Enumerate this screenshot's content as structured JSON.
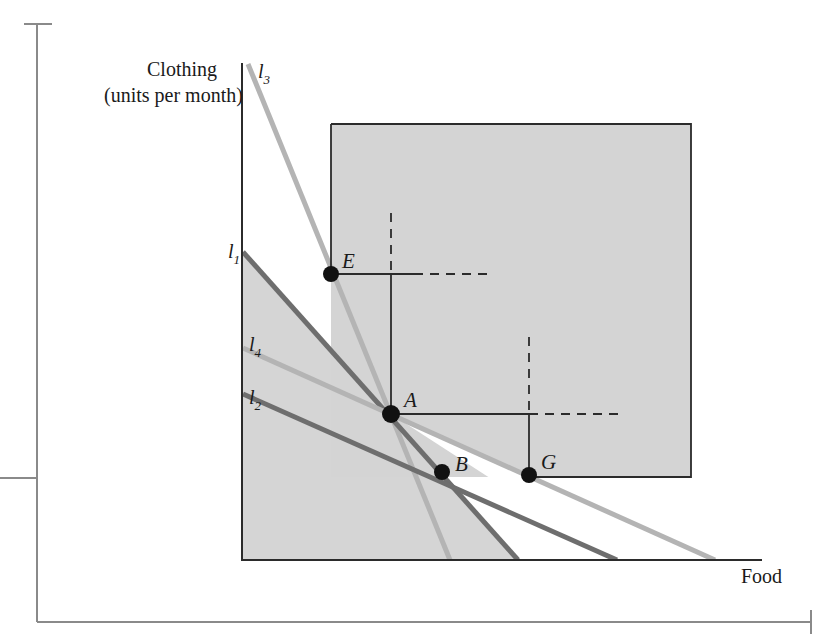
{
  "figure": {
    "axes": {
      "y_label_line1": "Clothing",
      "y_label_line2": "(units per month)",
      "x_label": "Food"
    },
    "line_labels": [
      {
        "id": "l3",
        "base": "l",
        "sub": "3"
      },
      {
        "id": "l1",
        "base": "l",
        "sub": "1"
      },
      {
        "id": "l4",
        "base": "l",
        "sub": "4"
      },
      {
        "id": "l2",
        "base": "l",
        "sub": "2"
      }
    ],
    "point_labels": [
      {
        "id": "E",
        "text": "E"
      },
      {
        "id": "A",
        "text": "A"
      },
      {
        "id": "B",
        "text": "B"
      },
      {
        "id": "G",
        "text": "G"
      }
    ],
    "colors": {
      "dark_line": "#6e6e6e",
      "light_line": "#b4b4b4",
      "shade": "#d4d4d4",
      "axis": "#2b2b2b",
      "frame": "#8a8a8a",
      "point": "#111111"
    }
  },
  "chart_data": {
    "type": "line",
    "title": "",
    "xlabel": "Food",
    "ylabel": "Clothing (units per month)",
    "xlim": [
      241,
      762
    ],
    "ylim": [
      560,
      63
    ],
    "grid": false,
    "legend": "inline-labels",
    "note": "Four budget lines all passing through the common point A; shaded rectangles mark the preferred-to regions relative to points E and G.",
    "series": [
      {
        "name": "l3",
        "label": "l_3",
        "color": "#b4b4b4",
        "style": "solid",
        "width": 5,
        "points": [
          [
            248,
            64
          ],
          [
            450,
            560
          ]
        ],
        "y_intercept_px": 64,
        "x_intercept_px": 450,
        "slope_px": -2.455
      },
      {
        "name": "l1",
        "label": "l_1",
        "color": "#6e6e6e",
        "style": "solid",
        "width": 5,
        "points": [
          [
            243,
            252
          ],
          [
            518,
            560
          ]
        ],
        "y_intercept_px": 252,
        "x_intercept_px": 518,
        "slope_px": -1.12
      },
      {
        "name": "l4",
        "label": "l_4",
        "color": "#b4b4b4",
        "style": "solid",
        "width": 5,
        "points": [
          [
            243,
            348
          ],
          [
            715,
            560
          ]
        ],
        "y_intercept_px": 348,
        "x_intercept_px": 715,
        "slope_px": -0.449
      },
      {
        "name": "l2",
        "label": "l_2",
        "color": "#6e6e6e",
        "style": "solid",
        "width": 5,
        "points": [
          [
            243,
            394
          ],
          [
            617,
            560
          ]
        ],
        "y_intercept_px": 394,
        "x_intercept_px": 617,
        "slope_px": -0.444
      }
    ],
    "points": [
      {
        "name": "E",
        "x": 331,
        "y": 274,
        "on": "l3"
      },
      {
        "name": "A",
        "x": 391,
        "y": 414,
        "on": "l1,l2,l3,l4"
      },
      {
        "name": "B",
        "x": 442,
        "y": 472,
        "on": "l1"
      },
      {
        "name": "G",
        "x": 529,
        "y": 475,
        "on": "l4"
      }
    ],
    "shaded_regions": [
      {
        "name": "preferred-to-E-and-G",
        "type": "rect",
        "x0": 331,
        "y0": 124,
        "x1": 691,
        "y1": 477
      },
      {
        "name": "below-budget-region",
        "type": "polygon",
        "vertices": [
          [
            241,
            253
          ],
          [
            518,
            560
          ],
          [
            241,
            560
          ]
        ]
      }
    ],
    "connector_lines": [
      {
        "from": "E",
        "kind": "horizontal-solid",
        "x0": 331,
        "x1": 414,
        "y": 274
      },
      {
        "from": "E",
        "kind": "horizontal-dashed",
        "x0": 414,
        "x1": 489,
        "y": 274
      },
      {
        "from": "E",
        "kind": "vertical-solid",
        "x": 391,
        "y0": 274,
        "y1": 414
      },
      {
        "from": "E",
        "kind": "vertical-dashed",
        "x": 391,
        "y0": 213,
        "y1": 274
      },
      {
        "from": "A",
        "kind": "horizontal-solid",
        "x0": 391,
        "x1": 529,
        "y": 414
      },
      {
        "from": "A",
        "kind": "horizontal-dashed",
        "x0": 529,
        "x1": 620,
        "y": 414
      },
      {
        "from": "G",
        "kind": "vertical-solid",
        "x": 529,
        "y0": 414,
        "y1": 475
      },
      {
        "from": "G",
        "kind": "vertical-dashed",
        "x": 529,
        "y0": 337,
        "y1": 414
      }
    ]
  }
}
